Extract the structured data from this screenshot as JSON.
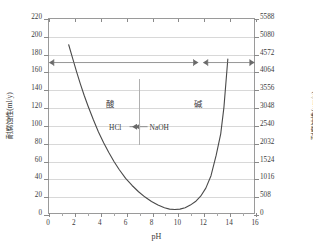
{
  "chart_data": {
    "type": "line",
    "title": "",
    "xlabel": "pH",
    "ylabel_left": "耐腐蚀性(ml/y)",
    "ylabel_right": "耐腐蚀性(μm/y)",
    "xlim": [
      0,
      16
    ],
    "ylim_left": [
      0,
      220
    ],
    "ylim_right": [
      0,
      5588
    ],
    "grid": true,
    "legend": "none",
    "xticks": [
      0,
      2,
      4,
      6,
      8,
      10,
      12,
      14,
      16
    ],
    "xticklabels": [
      "0",
      "2",
      "4",
      "6",
      "8",
      "10",
      "12",
      "14",
      "16"
    ],
    "yticks_left": [
      0,
      20,
      40,
      60,
      80,
      100,
      120,
      140,
      160,
      180,
      200,
      220
    ],
    "yticklabels_left": [
      "0",
      "20",
      "40",
      "60",
      "80",
      "100",
      "120",
      "140",
      "160",
      "180",
      "200",
      "220"
    ],
    "yticks_right": [
      0,
      508,
      1016,
      1524,
      2032,
      2540,
      3048,
      3556,
      4064,
      4572,
      5080,
      5588
    ],
    "yticklabels_right": [
      "0",
      "508",
      "1016",
      "1524",
      "2032",
      "2540",
      "3048",
      "3556",
      "4064",
      "4572",
      "5080",
      "5588"
    ],
    "series": [
      {
        "name": "corrosion-rate",
        "x": [
          1.6,
          1.9,
          2.2,
          2.5,
          2.8,
          3.1,
          3.5,
          3.9,
          4.3,
          4.7,
          5.1,
          5.5,
          6.0,
          6.5,
          7.0,
          7.5,
          8.0,
          8.5,
          9.0,
          9.4,
          9.8,
          10.2,
          10.6,
          11.0,
          11.4,
          11.8,
          12.2,
          12.6,
          13.0,
          13.35,
          13.6,
          13.9
        ],
        "y": [
          190,
          175,
          160,
          146,
          133,
          121,
          106,
          92,
          80,
          69,
          59,
          50,
          40,
          32,
          25,
          19,
          14,
          10,
          7,
          5.5,
          5,
          5.5,
          7,
          10,
          14,
          20,
          29,
          43,
          66,
          90,
          120,
          174
        ]
      }
    ],
    "annotations": [
      {
        "name": "acid-label",
        "text": "酸",
        "x": 4.8,
        "y_left": 125
      },
      {
        "name": "alkali-label",
        "text": "碱",
        "x": 11.6,
        "y_left": 125
      },
      {
        "name": "hcl-label",
        "text": "HCl",
        "x": 5.2,
        "y_left": 98
      },
      {
        "name": "naoh-label",
        "text": "NaOH",
        "x": 8.6,
        "y_left": 98
      },
      {
        "name": "neutral-divider",
        "text": "",
        "x": 7.0,
        "y_left": 110
      }
    ],
    "range_bars": [
      {
        "name": "acid-range-bar",
        "x_start": 0.45,
        "x_end": 11.25,
        "y_left": 170
      },
      {
        "name": "alkali-range-bar",
        "x_start": 12.35,
        "x_end": 15.6,
        "y_left": 170
      }
    ]
  }
}
